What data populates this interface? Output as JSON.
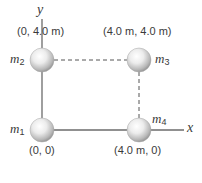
{
  "diagram": {
    "axes": {
      "x_label": "x",
      "y_label": "y",
      "axis_color": "#6b6b6b"
    },
    "masses": [
      {
        "name": "m",
        "subscript": "1",
        "coord_label": "(0, 0)",
        "x_m": 0,
        "y_m": 0
      },
      {
        "name": "m",
        "subscript": "2",
        "coord_label": "(0, 4.0 m)",
        "x_m": 0,
        "y_m": 4.0
      },
      {
        "name": "m",
        "subscript": "3",
        "coord_label": "(4.0 m, 4.0 m)",
        "x_m": 4.0,
        "y_m": 4.0
      },
      {
        "name": "m",
        "subscript": "4",
        "coord_label": "(4.0 m, 0)",
        "x_m": 4.0,
        "y_m": 0
      }
    ],
    "dashed_lines": [
      "m2-m3",
      "m3-m4"
    ],
    "sphere_color": "#d9d9d9"
  }
}
